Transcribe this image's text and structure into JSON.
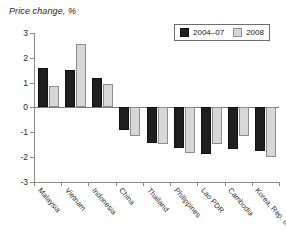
{
  "chart_data": {
    "type": "bar",
    "title": "Price change, %",
    "ylabel": "Price change, %",
    "xlabel": "",
    "ylim": [
      -3,
      3
    ],
    "yticks": [
      3,
      2,
      1,
      0,
      -1,
      -2,
      -3
    ],
    "ytick_labels": [
      "3",
      "2",
      "1",
      "0",
      "-1",
      "-2",
      "-3"
    ],
    "grid": false,
    "legend_position": "top-right",
    "categories": [
      "Malaysia",
      "Vietnam",
      "Indonesia",
      "China",
      "Thailand",
      "Philippines",
      "Lao PDR",
      "Cambodia",
      "Korea, Rep. of"
    ],
    "series": [
      {
        "name": "2004–07",
        "color": "#1f1f1f",
        "values": [
          1.6,
          1.5,
          1.18,
          -0.9,
          -1.45,
          -1.65,
          -1.9,
          -1.7,
          -1.75
        ]
      },
      {
        "name": "2008",
        "color": "#d7d7d7",
        "values": [
          0.87,
          2.55,
          0.93,
          -1.15,
          -1.5,
          -1.85,
          -1.5,
          -1.15,
          -2.0
        ]
      }
    ]
  },
  "legend": {
    "items": [
      {
        "label": "2004–07"
      },
      {
        "label": "2008"
      }
    ]
  }
}
